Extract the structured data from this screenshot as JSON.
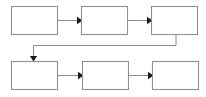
{
  "diagram": {
    "type": "flowchart",
    "title": "",
    "background_color": "#ffffff",
    "box_fill_color": "#ffffff",
    "box_border_color": "#8f8f8f",
    "connector_color": "#8a8a8a",
    "arrowhead_color": "#1a1a1a",
    "orientation": "left-to-right, wrapping to second row",
    "box_count": 6,
    "connector_count": 5,
    "rows": [
      {
        "row_index": 1,
        "boxes": [
          {
            "id": "box-1",
            "label": "",
            "x": 11,
            "y": 6,
            "width": 46,
            "height": 28
          },
          {
            "id": "box-2",
            "label": "",
            "x": 81,
            "y": 6,
            "width": 46,
            "height": 28
          },
          {
            "id": "box-3",
            "label": "",
            "x": 151,
            "y": 6,
            "width": 46,
            "height": 28
          }
        ]
      },
      {
        "row_index": 2,
        "boxes": [
          {
            "id": "box-4",
            "label": "",
            "x": 11,
            "y": 61,
            "width": 46,
            "height": 28
          },
          {
            "id": "box-5",
            "label": "",
            "x": 82,
            "y": 61,
            "width": 46,
            "height": 28
          },
          {
            "id": "box-6",
            "label": "",
            "x": 152,
            "y": 61,
            "width": 46,
            "height": 28
          }
        ]
      }
    ],
    "connectors": [
      {
        "id": "connector-1-to-2",
        "from": "box-1",
        "to": "box-2",
        "label": "",
        "direction": "right"
      },
      {
        "id": "connector-2-to-3",
        "from": "box-2",
        "to": "box-3",
        "label": "",
        "direction": "right"
      },
      {
        "id": "connector-3-to-4",
        "from": "box-3",
        "to": "box-4",
        "label": "",
        "direction": "wrap-down-left"
      },
      {
        "id": "connector-4-to-5",
        "from": "box-4",
        "to": "box-5",
        "label": "",
        "direction": "right"
      },
      {
        "id": "connector-5-to-6",
        "from": "box-5",
        "to": "box-6",
        "label": "",
        "direction": "right"
      }
    ]
  }
}
